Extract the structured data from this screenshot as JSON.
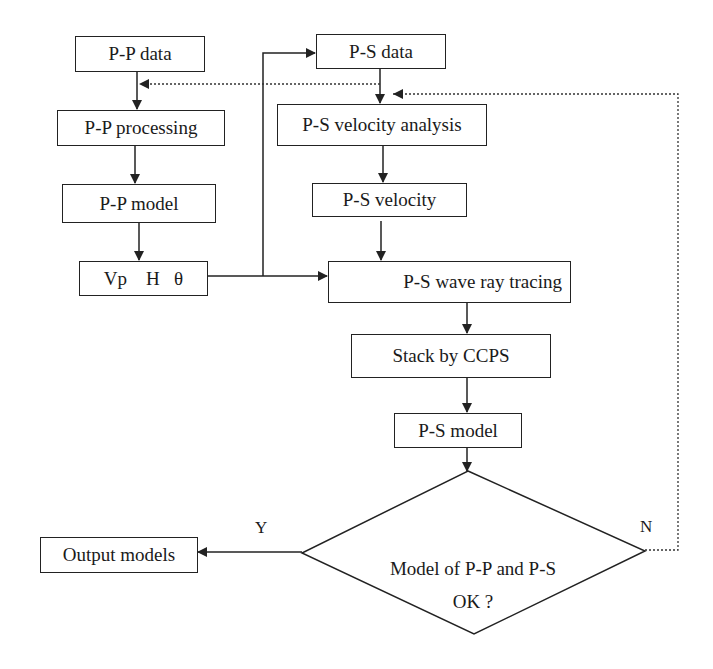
{
  "diagram": {
    "type": "flowchart",
    "nodes": {
      "pp_data": "P-P data",
      "pp_processing": "P-P processing",
      "pp_model": "P-P model",
      "vp_h_theta": "Vp    H   θ",
      "ps_data": "P-S data",
      "ps_velocity_analysis": "P-S velocity analysis",
      "ps_velocity": "P-S velocity",
      "ps_ray_tracing": "P-S wave ray tracing",
      "stack_ccps": "Stack by CCPS",
      "ps_model": "P-S model",
      "decision_line1": "Model of P-P and P-S",
      "decision_line2": "OK ?",
      "output_models": "Output models"
    },
    "edge_labels": {
      "yes": "Y",
      "no": "N"
    },
    "colors": {
      "line": "#222222",
      "background": "#ffffff"
    }
  }
}
